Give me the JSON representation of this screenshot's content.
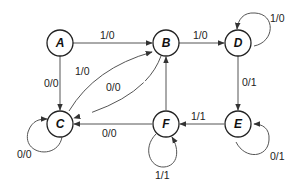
{
  "diagram": {
    "type": "state-machine",
    "nodes": [
      {
        "id": "A",
        "label": "A"
      },
      {
        "id": "B",
        "label": "B"
      },
      {
        "id": "C",
        "label": "C"
      },
      {
        "id": "D",
        "label": "D"
      },
      {
        "id": "E",
        "label": "E"
      },
      {
        "id": "F",
        "label": "F"
      }
    ],
    "edges": [
      {
        "from": "A",
        "to": "B",
        "label": "1/0"
      },
      {
        "from": "A",
        "to": "C",
        "label": "0/0"
      },
      {
        "from": "C",
        "to": "B",
        "label": "1/0"
      },
      {
        "from": "B",
        "to": "C",
        "label": "0/0"
      },
      {
        "from": "C",
        "to": "C",
        "label": "0/0"
      },
      {
        "from": "B",
        "to": "D",
        "label": "1/0"
      },
      {
        "from": "D",
        "to": "D",
        "label": "1/0"
      },
      {
        "from": "D",
        "to": "E",
        "label": "0/1"
      },
      {
        "from": "E",
        "to": "E",
        "label": "0/1"
      },
      {
        "from": "E",
        "to": "F",
        "label": "1/1"
      },
      {
        "from": "F",
        "to": "F",
        "label": "1/1"
      },
      {
        "from": "F",
        "to": "C",
        "label": "0/0"
      },
      {
        "from": "F",
        "to": "B",
        "label": "0/0"
      }
    ]
  }
}
